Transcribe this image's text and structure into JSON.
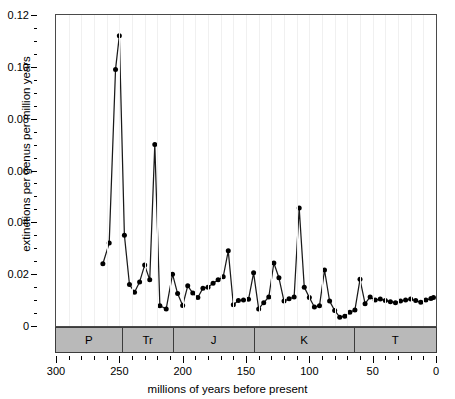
{
  "chart_data": {
    "type": "line",
    "title": "",
    "xlabel": "millions of years before present",
    "ylabel": "extinctions per genus per million years",
    "xlim": [
      300,
      0
    ],
    "ylim": [
      0,
      0.12
    ],
    "x_reversed": true,
    "grid": "vertical-faint",
    "legend": "none",
    "marker": "filled-circle",
    "xticks_major": [
      300,
      250,
      200,
      150,
      100,
      50,
      0
    ],
    "xticks_minor": [
      290,
      280,
      270,
      260,
      240,
      230,
      220,
      210,
      190,
      180,
      170,
      160,
      140,
      130,
      120,
      110,
      90,
      80,
      70,
      60,
      40,
      30,
      20,
      10
    ],
    "xtick_labels": [
      "300",
      "250",
      "200",
      "150",
      "100",
      "50",
      "0"
    ],
    "yticks_major": [
      0,
      0.02,
      0.04,
      0.06,
      0.08,
      0.1,
      0.12
    ],
    "yticks_minor": [
      0.005,
      0.01,
      0.015,
      0.025,
      0.03,
      0.035,
      0.045,
      0.05,
      0.055,
      0.065,
      0.07,
      0.075,
      0.085,
      0.09,
      0.095,
      0.105,
      0.11,
      0.115
    ],
    "ytick_labels": [
      "0",
      "0.02",
      "0.04",
      "0.06",
      "0.08",
      "0.10",
      "0.12"
    ],
    "x": [
      263,
      258,
      253,
      250,
      246,
      242,
      238,
      234,
      230,
      226,
      222,
      218,
      213,
      208,
      204,
      200,
      196,
      192,
      188,
      184,
      180,
      176,
      172,
      168,
      164,
      160,
      156,
      152,
      148,
      144,
      140,
      136,
      132,
      128,
      124,
      120,
      116,
      112,
      108,
      104,
      100,
      96,
      92,
      88,
      84,
      80,
      76,
      72,
      68,
      64,
      60,
      56,
      52,
      48,
      44,
      40,
      36,
      32,
      28,
      24,
      20,
      16,
      12,
      8,
      4,
      2
    ],
    "values": [
      0.024,
      0.032,
      0.099,
      0.112,
      0.035,
      0.016,
      0.013,
      0.017,
      0.0235,
      0.0178,
      0.07,
      0.0078,
      0.0066,
      0.02,
      0.0125,
      0.0079,
      0.0155,
      0.0127,
      0.011,
      0.0146,
      0.015,
      0.0165,
      0.0178,
      0.019,
      0.029,
      0.0082,
      0.0098,
      0.01,
      0.0103,
      0.0205,
      0.0066,
      0.009,
      0.0112,
      0.0243,
      0.0186,
      0.0096,
      0.0105,
      0.0112,
      0.0455,
      0.015,
      0.011,
      0.0073,
      0.0078,
      0.0216,
      0.0096,
      0.006,
      0.0034,
      0.0038,
      0.0053,
      0.0062,
      0.018,
      0.0086,
      0.0112,
      0.01,
      0.0104,
      0.0098,
      0.0094,
      0.009,
      0.0096,
      0.01,
      0.0104,
      0.0098,
      0.0092,
      0.01,
      0.0106,
      0.011
    ],
    "periods": [
      {
        "label": "P",
        "start": 300,
        "end": 248
      },
      {
        "label": "Tr",
        "start": 248,
        "end": 208
      },
      {
        "label": "J",
        "start": 208,
        "end": 144
      },
      {
        "label": "K",
        "start": 144,
        "end": 65
      },
      {
        "label": "T",
        "start": 65,
        "end": 0
      }
    ],
    "colors": {
      "line": "#1a1a1a",
      "marker": "#000000",
      "band_fill": "#b9b9b9",
      "band_stroke": "#3c3c3c",
      "frame": "#4a4a4a",
      "grid": "#f0f0f0"
    }
  }
}
